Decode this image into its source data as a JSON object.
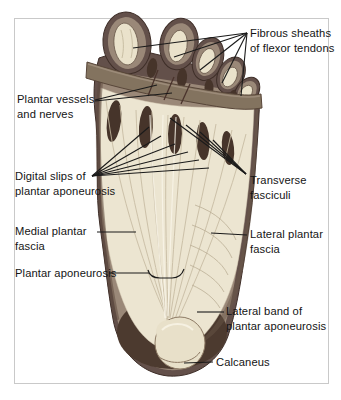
{
  "labels": {
    "fibrous_sheaths": "Fibrous sheaths\nof flexor tendons",
    "plantar_vessels": "Plantar vessels\nand nerves",
    "digital_slips": "Digital slips of\nplantar aponeurosis",
    "transverse_fasciculi": "Transverse\nfasciculi",
    "medial_plantar_fascia": "Medial plantar\nfascia",
    "lateral_plantar_fascia": "Lateral plantar\nfascia",
    "plantar_aponeurosis": "Plantar aponeurosis",
    "lateral_band": "Lateral band of\nplantar aponeurosis",
    "calcaneus": "Calcaneus"
  },
  "colors": {
    "background": "#ffffff",
    "panel_border": "#c9c9c9",
    "label_text": "#141414",
    "leader_line": "#1a1a1a",
    "skin_edge": "#63504a",
    "skin_edge_dark": "#3e2e28",
    "toe_pad": "#9a8878",
    "tendon_sheath": "#eae2cb",
    "fascia": "#ece5d1",
    "fascia_striation": "#c7bba2",
    "slip_gap": "#46342a",
    "metatarsal_band": "#83735f",
    "heel_interior": "#4c3a2f",
    "calcaneus_fill": "#e8e0c9"
  }
}
